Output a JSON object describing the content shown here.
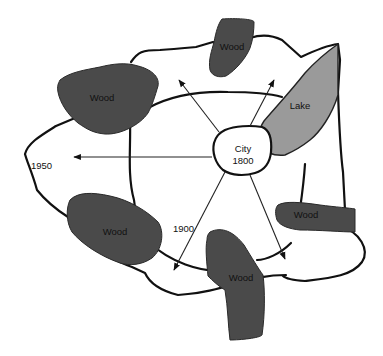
{
  "diagram": {
    "title": "",
    "city": {
      "line1": "City",
      "line2": "1800"
    },
    "years": {
      "y1900": "1900",
      "y1950": "1950"
    },
    "features": {
      "wood_top": "Wood",
      "wood_left": "Wood",
      "wood_lower_left": "Wood",
      "wood_bottom": "Wood",
      "wood_right": "Wood",
      "lake": "Lake"
    },
    "colors": {
      "wood": "#4a4a4a",
      "lake": "#9a9a9a",
      "outline": "#111111",
      "background": "#ffffff"
    }
  }
}
